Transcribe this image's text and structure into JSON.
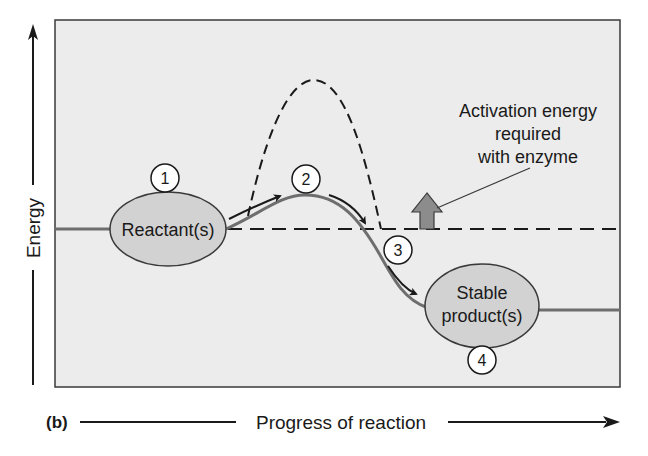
{
  "figure": {
    "panel_label": "(b)",
    "x_axis_label": "Progress of reaction",
    "y_axis_label": "Energy",
    "annotation": {
      "lines": [
        "Activation energy",
        "required",
        "with enzyme"
      ]
    },
    "states": {
      "reactant": "Reactant(s)",
      "product_line1": "Stable",
      "product_line2": "product(s)"
    },
    "steps": [
      "1",
      "2",
      "3",
      "4"
    ],
    "colors": {
      "frame_bg": "#ececec",
      "frame_border": "#3a3a3a",
      "curve": "#6e6e6e",
      "ellipse_fill": "#d2d2d2",
      "arrow_fill": "#8c8c8c",
      "text": "#1a1a1a"
    }
  }
}
